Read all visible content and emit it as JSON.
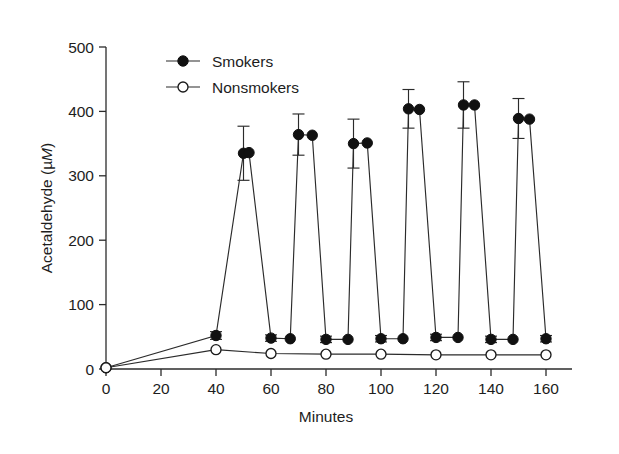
{
  "figure": {
    "border_color": "#4a4a4a",
    "background": "#ffffff"
  },
  "chart_data": {
    "type": "line",
    "title": "",
    "xlabel": "Minutes",
    "ylabel": "Acetaldehyde (µM)",
    "ylabel_unit_italic": "M",
    "xlim": [
      0,
      165
    ],
    "ylim": [
      0,
      500
    ],
    "xticks": [
      0,
      20,
      40,
      60,
      80,
      100,
      120,
      140,
      160
    ],
    "yticks": [
      0,
      100,
      200,
      300,
      400,
      500
    ],
    "grid": false,
    "legend_position": "top-left",
    "legend": [
      "Smokers",
      "Nonsmokers"
    ],
    "series": [
      {
        "name": "Smokers",
        "marker": "filled-circle",
        "color": "#111111",
        "points": [
          {
            "x": 0,
            "y": 2,
            "err": 0
          },
          {
            "x": 40,
            "y": 52,
            "err": 6
          },
          {
            "x": 50,
            "y": 335,
            "err": 42
          },
          {
            "x": 52,
            "y": 336,
            "err": 0
          },
          {
            "x": 60,
            "y": 48,
            "err": 5
          },
          {
            "x": 67,
            "y": 47,
            "err": 0
          },
          {
            "x": 70,
            "y": 364,
            "err": 32
          },
          {
            "x": 75,
            "y": 363,
            "err": 0
          },
          {
            "x": 80,
            "y": 46,
            "err": 5
          },
          {
            "x": 88,
            "y": 46,
            "err": 0
          },
          {
            "x": 90,
            "y": 350,
            "err": 38
          },
          {
            "x": 95,
            "y": 351,
            "err": 0
          },
          {
            "x": 100,
            "y": 47,
            "err": 5
          },
          {
            "x": 108,
            "y": 47,
            "err": 0
          },
          {
            "x": 110,
            "y": 404,
            "err": 30
          },
          {
            "x": 114,
            "y": 403,
            "err": 0
          },
          {
            "x": 120,
            "y": 49,
            "err": 5
          },
          {
            "x": 128,
            "y": 49,
            "err": 0
          },
          {
            "x": 130,
            "y": 410,
            "err": 36
          },
          {
            "x": 134,
            "y": 410,
            "err": 0
          },
          {
            "x": 140,
            "y": 46,
            "err": 5
          },
          {
            "x": 148,
            "y": 46,
            "err": 0
          },
          {
            "x": 150,
            "y": 389,
            "err": 31
          },
          {
            "x": 154,
            "y": 388,
            "err": 0
          },
          {
            "x": 160,
            "y": 47,
            "err": 5
          }
        ]
      },
      {
        "name": "Nonsmokers",
        "marker": "open-circle",
        "color": "#ffffff",
        "points": [
          {
            "x": 0,
            "y": 2,
            "err": 0
          },
          {
            "x": 40,
            "y": 30,
            "err": 0
          },
          {
            "x": 60,
            "y": 24,
            "err": 0
          },
          {
            "x": 80,
            "y": 23,
            "err": 0
          },
          {
            "x": 100,
            "y": 23,
            "err": 0
          },
          {
            "x": 120,
            "y": 22,
            "err": 0
          },
          {
            "x": 140,
            "y": 22,
            "err": 0
          },
          {
            "x": 160,
            "y": 22,
            "err": 0
          }
        ]
      }
    ]
  }
}
